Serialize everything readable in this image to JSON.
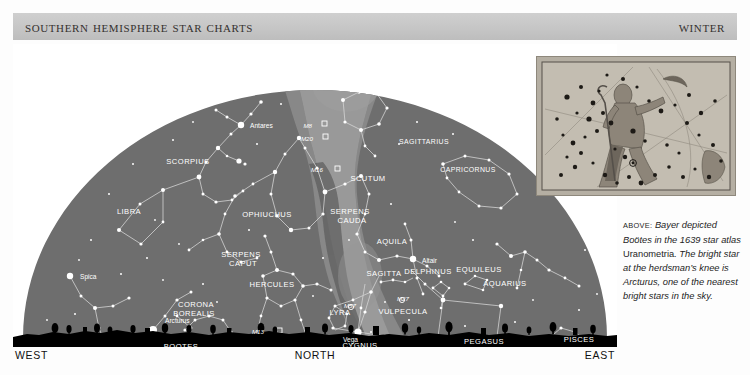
{
  "header": {
    "title": "Southern Hemisphere Star Charts",
    "season": "Winter"
  },
  "chart": {
    "compass": {
      "west": "WEST",
      "north": "NORTH",
      "east": "EAST"
    },
    "colors": {
      "header_band": "#c6c6c6",
      "sky": "#6e6e6e",
      "milky_way": "#8a8a8a",
      "milky_way_core": "#9c9c9c",
      "milky_way_dust": "#5d5d5d",
      "star": "#ffffff",
      "constellation_line": "#d8d8d8",
      "horizon": "#000000",
      "page": "#ffffff"
    },
    "constellations": [
      {
        "name": "SCORPIUS",
        "x": 175,
        "y": 120
      },
      {
        "name": "LIBRA",
        "x": 116,
        "y": 170
      },
      {
        "name": "OPHIUCHUS",
        "x": 254,
        "y": 173
      },
      {
        "name": "SERPENS",
        "x": 228,
        "y": 213
      },
      {
        "name": "CAPUT",
        "x": 230,
        "y": 222
      },
      {
        "name": "SERPENS",
        "x": 337,
        "y": 170
      },
      {
        "name": "CAUDA",
        "x": 339,
        "y": 179
      },
      {
        "name": "SCUTUM",
        "x": 355,
        "y": 137
      },
      {
        "name": "SAGITTARIUS",
        "x": 411,
        "y": 100
      },
      {
        "name": "CAPRICORNUS",
        "x": 455,
        "y": 128
      },
      {
        "name": "AQUILA",
        "x": 379,
        "y": 200
      },
      {
        "name": "SAGITTA",
        "x": 371,
        "y": 232
      },
      {
        "name": "DELPHINUS",
        "x": 415,
        "y": 230
      },
      {
        "name": "EQUULEUS",
        "x": 466,
        "y": 228
      },
      {
        "name": "AQUARIUS",
        "x": 492,
        "y": 242
      },
      {
        "name": "VULPECULA",
        "x": 390,
        "y": 270
      },
      {
        "name": "LYRA",
        "x": 327,
        "y": 271
      },
      {
        "name": "CYGNUS",
        "x": 347,
        "y": 304
      },
      {
        "name": "HERCULES",
        "x": 259,
        "y": 243
      },
      {
        "name": "CORONA",
        "x": 183,
        "y": 263
      },
      {
        "name": "BOREALIS",
        "x": 181,
        "y": 272
      },
      {
        "name": "BOOTES",
        "x": 168,
        "y": 305
      },
      {
        "name": "VIRGO",
        "x": 58,
        "y": 317
      },
      {
        "name": "COMA BERENICES",
        "x": 122,
        "y": 331
      },
      {
        "name": "DRACO",
        "x": 281,
        "y": 327
      },
      {
        "name": "PEGASUS",
        "x": 471,
        "y": 300
      },
      {
        "name": "PISCES",
        "x": 566,
        "y": 298
      }
    ],
    "stars_named": [
      {
        "name": "Antares",
        "x": 237,
        "y": 84,
        "sx": 228,
        "sy": 81,
        "r": 3.2
      },
      {
        "name": "Spica",
        "x": 67,
        "y": 235,
        "sx": 57,
        "sy": 232,
        "r": 3.2
      },
      {
        "name": "Arcturus",
        "x": 152,
        "y": 279,
        "sx": 140,
        "sy": 286,
        "r": 4.0
      },
      {
        "name": "Vega",
        "x": 330,
        "y": 298,
        "sx": 345,
        "sy": 288,
        "r": 3.6
      },
      {
        "name": "Altair",
        "x": 409,
        "y": 219,
        "sx": 400,
        "sy": 215,
        "r": 3.2
      },
      {
        "name": "Deneb",
        "x": 363,
        "y": 331,
        "sx": 356,
        "sy": 327,
        "r": 3.2
      }
    ],
    "deep_sky_objects": [
      {
        "name": "M8",
        "x": 299,
        "y": 84,
        "mx": 311,
        "my": 80
      },
      {
        "name": "M20",
        "x": 300,
        "y": 97,
        "mx": 312,
        "my": 93
      },
      {
        "name": "M16",
        "x": 310,
        "y": 128,
        "mx": 324,
        "my": 125
      },
      {
        "name": "M13",
        "x": 251,
        "y": 290,
        "mx": 266,
        "my": 287
      },
      {
        "name": "M57",
        "x": 343,
        "y": 264,
        "mx": 336,
        "my": 261
      },
      {
        "name": "M27",
        "x": 396,
        "y": 257,
        "mx": 387,
        "my": 254
      }
    ]
  },
  "inset": {
    "alt": "Engraving of Bootes the herdsman from Bayer's Uranometria star atlas"
  },
  "caption": {
    "lead": "ABOVE:",
    "part1": " Bayer depicted Boötes in the 1639 star atlas ",
    "roman": "Uranometria",
    "part2": ". The bright star at the herdsman’s knee is Arcturus, one of the nearest bright stars in the sky."
  }
}
